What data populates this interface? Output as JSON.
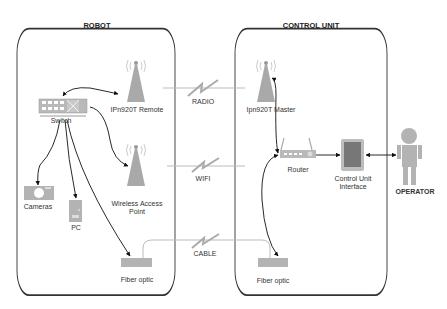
{
  "containers": {
    "robot": {
      "title": "ROBOT"
    },
    "control_unit": {
      "title": "CONTROL UNIT"
    }
  },
  "nodes": {
    "switch": "Switch",
    "ipn_remote": "IPn920T Remote",
    "cameras": "Cameras",
    "pc": "PC",
    "wap_line1": "Wireless Access",
    "wap_line2": "Point",
    "fiber_robot": "Fiber optic",
    "ipn_master": "Ipn920T Master",
    "router": "Router",
    "cui_line1": "Control Unit",
    "cui_line2": "Interface",
    "fiber_cu": "Fiber optic",
    "operator": "OPERATOR"
  },
  "links": {
    "radio": "RADIO",
    "wifi": "WIFI",
    "cable": "CABLE"
  },
  "colors": {
    "icon_gray": "#a9a9a9",
    "line": "#222222",
    "link_line": "#bbbbbb"
  }
}
